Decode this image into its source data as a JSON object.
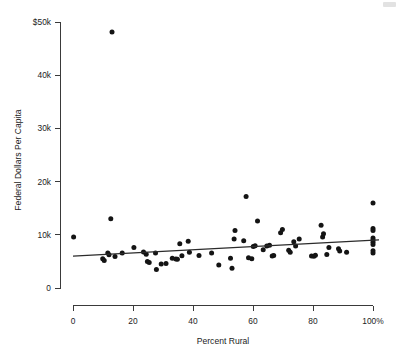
{
  "chart_data": {
    "type": "scatter",
    "title": "",
    "subtitle": "",
    "xlabel": "Percent Rural",
    "ylabel": "Federal Dollars Per Capita",
    "xlim": [
      0,
      100
    ],
    "ylim": [
      0,
      50000
    ],
    "grid": false,
    "legend": null,
    "x_tick_labels": [
      "0",
      "20",
      "40",
      "60",
      "80",
      "100%"
    ],
    "x_tick_values": [
      0,
      20,
      40,
      60,
      80,
      100
    ],
    "y_tick_labels": [
      "0",
      "10k",
      "20k",
      "30k",
      "40k",
      "$50k"
    ],
    "y_tick_values": [
      0,
      10000,
      20000,
      30000,
      40000,
      50000
    ],
    "series": [
      {
        "name": "States",
        "marker": "filled-circle",
        "color": "#141414",
        "points": [
          [
            0.2,
            9600
          ],
          [
            9.9,
            5500
          ],
          [
            10.4,
            5150
          ],
          [
            11.6,
            6600
          ],
          [
            12.0,
            6250
          ],
          [
            13.0,
            48100
          ],
          [
            12.6,
            13000
          ],
          [
            14.0,
            5900
          ],
          [
            16.4,
            6600
          ],
          [
            20.3,
            7600
          ],
          [
            23.5,
            6750
          ],
          [
            24.4,
            6350
          ],
          [
            24.8,
            5000
          ],
          [
            25.4,
            4800
          ],
          [
            27.5,
            6600
          ],
          [
            27.8,
            3500
          ],
          [
            29.4,
            4500
          ],
          [
            31.0,
            4600
          ],
          [
            33.1,
            5600
          ],
          [
            34.3,
            5450
          ],
          [
            34.8,
            5400
          ],
          [
            35.6,
            8300
          ],
          [
            36.3,
            6050
          ],
          [
            38.4,
            8800
          ],
          [
            38.8,
            6700
          ],
          [
            42.0,
            6100
          ],
          [
            46.2,
            6600
          ],
          [
            48.6,
            4300
          ],
          [
            52.5,
            5600
          ],
          [
            53.0,
            3700
          ],
          [
            53.7,
            9200
          ],
          [
            54.0,
            10800
          ],
          [
            56.9,
            8900
          ],
          [
            57.7,
            17200
          ],
          [
            58.5,
            5700
          ],
          [
            59.6,
            5500
          ],
          [
            60.1,
            7800
          ],
          [
            60.7,
            7950
          ],
          [
            61.5,
            12600
          ],
          [
            63.4,
            7200
          ],
          [
            64.6,
            7900
          ],
          [
            65.5,
            8050
          ],
          [
            66.4,
            6000
          ],
          [
            66.9,
            6100
          ],
          [
            69.2,
            10400
          ],
          [
            69.8,
            11000
          ],
          [
            71.9,
            7100
          ],
          [
            72.4,
            6700
          ],
          [
            73.6,
            8700
          ],
          [
            74.2,
            7900
          ],
          [
            75.4,
            9200
          ],
          [
            79.5,
            6000
          ],
          [
            80.3,
            5950
          ],
          [
            80.8,
            6150
          ],
          [
            82.7,
            11800
          ],
          [
            83.2,
            9600
          ],
          [
            83.5,
            10200
          ],
          [
            84.6,
            6300
          ],
          [
            85.3,
            7600
          ],
          [
            88.5,
            7400
          ],
          [
            88.9,
            6950
          ],
          [
            91.2,
            6700
          ],
          [
            100.0,
            16000
          ],
          [
            100.0,
            11200
          ],
          [
            100.0,
            10800
          ],
          [
            100.0,
            9400
          ],
          [
            100.0,
            9000
          ],
          [
            100.0,
            8600
          ],
          [
            100.0,
            8200
          ],
          [
            100.0,
            7000
          ],
          [
            100.0,
            6600
          ]
        ]
      }
    ],
    "trend_line": {
      "name": "linear fit",
      "x_start": 0,
      "y_start": 6000,
      "x_end": 102,
      "y_end": 9050,
      "color": "#2b2b2b"
    }
  }
}
